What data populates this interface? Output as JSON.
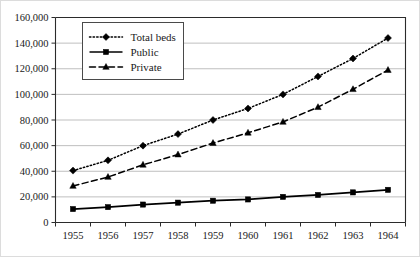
{
  "chart_data": {
    "type": "line",
    "title": "",
    "subtitle": "",
    "xlabel": "",
    "ylabel": "",
    "categories": [
      "1955",
      "1956",
      "1957",
      "1958",
      "1959",
      "1960",
      "1961",
      "1962",
      "1963",
      "1964"
    ],
    "x": [
      1955,
      1956,
      1957,
      1958,
      1959,
      1960,
      1961,
      1962,
      1963,
      1964
    ],
    "ylim": [
      0,
      160000
    ],
    "ytick_step": 20000,
    "ytick_labels": [
      "0",
      "20,000",
      "40,000",
      "60,000",
      "80,000",
      "100,000",
      "120,000",
      "140,000",
      "160,000"
    ],
    "ytick_values": [
      0,
      20000,
      40000,
      60000,
      80000,
      100000,
      120000,
      140000,
      160000
    ],
    "grid": "horizontal",
    "legend_position": "top-left-inside",
    "series": [
      {
        "name": "Total beds",
        "marker": "diamond",
        "line_style": "dotted",
        "color": "#000000",
        "values": [
          40500,
          48500,
          60000,
          69000,
          80000,
          89000,
          100000,
          114000,
          128000,
          144000
        ]
      },
      {
        "name": "Public",
        "marker": "square",
        "line_style": "solid",
        "color": "#000000",
        "values": [
          10500,
          12000,
          14000,
          15500,
          17000,
          18000,
          20000,
          21500,
          23500,
          25500
        ]
      },
      {
        "name": "Private",
        "marker": "triangle",
        "line_style": "dashed",
        "color": "#000000",
        "values": [
          28500,
          35500,
          45000,
          53000,
          62000,
          70000,
          78500,
          90000,
          104000,
          119000
        ]
      }
    ]
  },
  "legend": {
    "entries": [
      {
        "label": "Total beds"
      },
      {
        "label": "Public"
      },
      {
        "label": "Private"
      }
    ]
  }
}
